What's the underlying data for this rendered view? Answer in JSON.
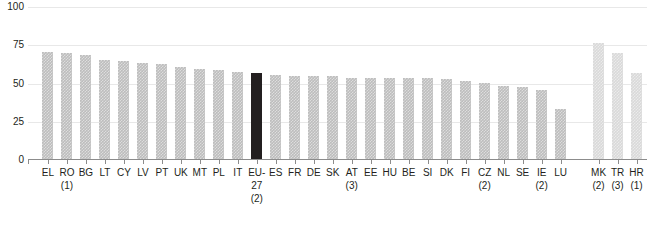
{
  "chart_data": {
    "type": "bar",
    "title": "",
    "subtitle": "",
    "xlabel": "",
    "ylabel": "",
    "ylim": [
      0,
      100
    ],
    "y_ticks": [
      0,
      25,
      50,
      75,
      100
    ],
    "grid": true,
    "legend": null,
    "categories": [
      "EL",
      "RO",
      "BG",
      "LT",
      "CY",
      "LV",
      "PT",
      "UK",
      "MT",
      "PL",
      "IT",
      "EU-27",
      "ES",
      "FR",
      "DE",
      "SK",
      "AT",
      "EE",
      "HU",
      "BE",
      "SI",
      "DK",
      "FI",
      "CZ",
      "NL",
      "SE",
      "IE",
      "LU",
      "MK",
      "TR",
      "HR"
    ],
    "category_notes": [
      "",
      "(1)",
      "",
      "",
      "",
      "",
      "",
      "",
      "",
      "",
      "",
      "(2)",
      "",
      "",
      "",
      "",
      "(3)",
      "",
      "",
      "",
      "",
      "",
      "",
      "(2)",
      "",
      "",
      "(2)",
      "",
      "(2)",
      "(3)",
      "(1)"
    ],
    "values": [
      70,
      69,
      68,
      65,
      64,
      63,
      62,
      60,
      59,
      58,
      57,
      56,
      55,
      54,
      54,
      54,
      53,
      53,
      53,
      53,
      53,
      52,
      51,
      50,
      48,
      47,
      45,
      33,
      76,
      69,
      56
    ],
    "bar_styles": [
      "standard",
      "standard",
      "standard",
      "standard",
      "standard",
      "standard",
      "standard",
      "standard",
      "standard",
      "standard",
      "standard",
      "highlight",
      "standard",
      "standard",
      "standard",
      "standard",
      "standard",
      "standard",
      "standard",
      "standard",
      "standard",
      "standard",
      "standard",
      "standard",
      "standard",
      "standard",
      "standard",
      "standard",
      "candidate",
      "candidate",
      "candidate"
    ],
    "gap_after_index": 27,
    "colors": {
      "standard": "#bdbdbd",
      "highlight": "#231f20",
      "candidate": "#d9d9d9",
      "gridline": "#e8e8e8",
      "axis": "#8c8c8c",
      "text": "#231f20"
    }
  }
}
